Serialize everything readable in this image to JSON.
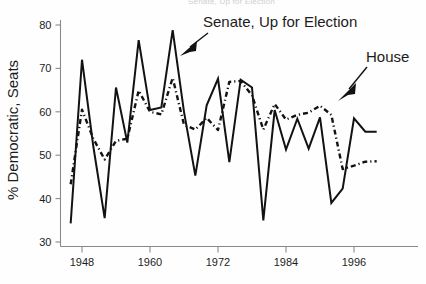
{
  "figure": {
    "ghost_header": "Senate, Up for Election",
    "ylabel": "% Democratic, Seats",
    "annotations": {
      "senate": "Senate, Up for Election",
      "house": "House"
    }
  },
  "axes": {
    "y_ticks": [
      "30",
      "40",
      "50",
      "60",
      "70",
      "80"
    ],
    "x_ticks": [
      "1948",
      "1960",
      "1972",
      "1984",
      "1996"
    ]
  },
  "chart_data": {
    "type": "line",
    "title": "",
    "xlabel": "",
    "ylabel": "% Democratic, Seats",
    "xlim": [
      1945,
      2002
    ],
    "ylim": [
      30,
      80
    ],
    "grid": false,
    "legend": "annotations-with-arrows",
    "x_tick_values": [
      1948,
      1960,
      1972,
      1984,
      1996
    ],
    "y_tick_values": [
      30,
      40,
      50,
      60,
      70,
      80
    ],
    "series": [
      {
        "name": "Senate, Up for Election",
        "style": "solid",
        "color": "#121212",
        "x": [
          1946,
          1948,
          1950,
          1952,
          1954,
          1956,
          1958,
          1960,
          1962,
          1964,
          1966,
          1968,
          1970,
          1972,
          1974,
          1976,
          1978,
          1980,
          1982,
          1984,
          1986,
          1988,
          1990,
          1992,
          1994,
          1996,
          1998,
          2000
        ],
        "values": [
          34.3,
          72.0,
          52.0,
          35.5,
          65.6,
          52.9,
          76.5,
          60.4,
          61.0,
          78.8,
          60.0,
          45.3,
          61.5,
          67.6,
          48.4,
          67.4,
          65.6,
          35.0,
          60.4,
          51.3,
          58.4,
          51.5,
          58.7,
          39.0,
          42.3,
          58.5,
          55.4,
          55.4
        ]
      },
      {
        "name": "House",
        "style": "dash-dot",
        "color": "#121212",
        "x": [
          1946,
          1948,
          1950,
          1952,
          1954,
          1956,
          1958,
          1960,
          1962,
          1964,
          1966,
          1968,
          1970,
          1972,
          1974,
          1976,
          1978,
          1980,
          1982,
          1984,
          1986,
          1988,
          1990,
          1992,
          1994,
          1996,
          1998,
          2000
        ],
        "values": [
          43.3,
          60.5,
          53.8,
          49.0,
          53.3,
          53.8,
          64.9,
          60.0,
          59.4,
          67.8,
          57.0,
          55.9,
          58.6,
          55.8,
          66.9,
          67.1,
          63.8,
          55.9,
          61.8,
          58.2,
          59.3,
          59.8,
          61.4,
          59.3,
          46.8,
          47.6,
          48.5,
          48.6
        ]
      }
    ]
  }
}
